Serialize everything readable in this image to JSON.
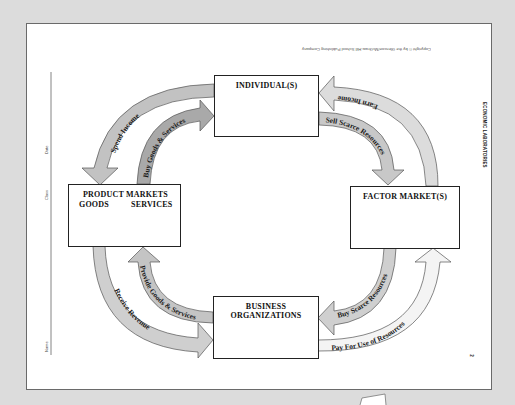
{
  "worksheet": {
    "copyright": "Copyright © by the Glencoe/McGraw-Hill School Publishing Company",
    "series_label": "ECONOMIC LABORATORIES",
    "page_number": "2",
    "header_fields": {
      "name_label": "Name",
      "class_label": "Class",
      "date_label": "Date"
    }
  },
  "diagram": {
    "nodes": {
      "individuals": {
        "label": "INDIVIDUAL(S)"
      },
      "product_markets": {
        "label": "PRODUCT  MARKETS",
        "left_sub": "GOODS",
        "right_sub": "SERVICES"
      },
      "factor_markets": {
        "label": "FACTOR  MARKET(S)"
      },
      "business": {
        "label": "BUSINESS  ORGANIZATIONS"
      }
    },
    "flows": [
      {
        "id": "spend_income",
        "label": "Spend Income",
        "from": "INDIVIDUAL(S)",
        "to": "PRODUCT MARKETS"
      },
      {
        "id": "buy_goods",
        "label": "Buy Goods & Services",
        "from": "PRODUCT MARKETS",
        "to": "INDIVIDUAL(S)"
      },
      {
        "id": "earn_income",
        "label": "Earn Income",
        "from": "FACTOR MARKET(S)",
        "to": "INDIVIDUAL(S)"
      },
      {
        "id": "sell_resources",
        "label": "Sell Scarce Resources",
        "from": "INDIVIDUAL(S)",
        "to": "FACTOR MARKET(S)"
      },
      {
        "id": "receive_revenue",
        "label": "Receive Revenue",
        "from": "PRODUCT MARKETS",
        "to": "BUSINESS ORGANIZATIONS"
      },
      {
        "id": "provide_goods",
        "label": "Provide Goods & Services",
        "from": "BUSINESS ORGANIZATIONS",
        "to": "PRODUCT MARKETS"
      },
      {
        "id": "buy_resources",
        "label": "Buy Scarce Resources",
        "from": "FACTOR MARKET(S)",
        "to": "BUSINESS ORGANIZATIONS"
      },
      {
        "id": "pay_resources",
        "label": "Pay For Use of Resources",
        "from": "BUSINESS ORGANIZATIONS",
        "to": "FACTOR MARKET(S)"
      }
    ],
    "colors": {
      "arrow_dark": "#b9b9b9",
      "arrow_light": "#e3e3e3",
      "arrow_white": "#f6f6f6",
      "outline": "#555555"
    }
  }
}
